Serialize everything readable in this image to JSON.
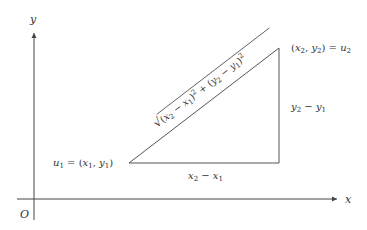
{
  "diagram": {
    "axes": {
      "x_label": "x",
      "y_label": "y",
      "origin_label": "O"
    },
    "points": {
      "u1": {
        "name": "u",
        "index": "1",
        "equals": " = (",
        "x": "x",
        "x_index": "1",
        "comma": ", ",
        "y": "y",
        "y_index": "1",
        "close": ")"
      },
      "u2": {
        "open": "(",
        "x": "x",
        "x_index": "2",
        "comma": ", ",
        "y": "y",
        "y_index": "2",
        "close": ") = ",
        "name": "u",
        "index": "2"
      }
    },
    "edges": {
      "horizontal": {
        "a": "x",
        "a_index": "2",
        "minus": " − ",
        "b": "x",
        "b_index": "1"
      },
      "vertical": {
        "a": "y",
        "a_index": "2",
        "minus": " − ",
        "b": "y",
        "b_index": "1"
      },
      "hypotenuse": {
        "sqrt": "√",
        "p1_open": "(",
        "x2": "x",
        "x2_index": "2",
        "m1": " − ",
        "x1": "x",
        "x1_index": "1",
        "p1_close": ")",
        "exp1": "2",
        "plus": " + ",
        "p2_open": "(",
        "y2": "y",
        "y2_index": "2",
        "m2": " − ",
        "y1": "y",
        "y1_index": "1",
        "p2_close": ")",
        "exp2": "2"
      }
    },
    "colors": {
      "axis": "#444444",
      "triangle": "#555555",
      "text": "#333333"
    }
  }
}
